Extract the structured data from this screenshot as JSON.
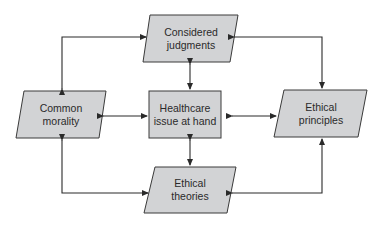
{
  "diagram": {
    "nodes": {
      "considered": {
        "line1": "Considered",
        "line2": "judgments"
      },
      "common": {
        "line1": "Common",
        "line2": "morality"
      },
      "healthcare": {
        "line1": "Healthcare",
        "line2": "issue at hand"
      },
      "principles": {
        "line1": "Ethical",
        "line2": "principles"
      },
      "theories": {
        "line1": "Ethical",
        "line2": "theories"
      }
    },
    "colors": {
      "fill": "#d2d3d5",
      "stroke": "#3a3a3a",
      "arrow": "#2a2a2a"
    }
  }
}
